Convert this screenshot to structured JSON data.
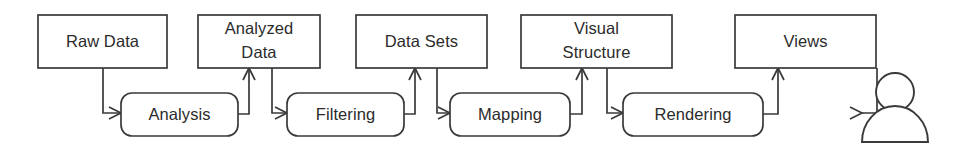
{
  "diagram": {
    "type": "flow-diagram",
    "stroke_color": "#3a3a3a",
    "text_color": "#2b2b2b",
    "background_color": "#ffffff",
    "data_nodes": [
      {
        "id": "raw-data",
        "label": "Raw Data",
        "lines": [
          "Raw Data"
        ],
        "shape": "rectangle",
        "x": 38,
        "y": 15,
        "w": 129,
        "h": 53
      },
      {
        "id": "analyzed-data",
        "label": "Analyzed Data",
        "lines": [
          "Analyzed",
          "Data"
        ],
        "shape": "rectangle",
        "x": 198,
        "y": 15,
        "w": 122,
        "h": 53
      },
      {
        "id": "data-sets",
        "label": "Data Sets",
        "lines": [
          "Data Sets"
        ],
        "shape": "rectangle",
        "x": 356,
        "y": 15,
        "w": 131,
        "h": 53
      },
      {
        "id": "visual-structure",
        "label": "Visual Structure",
        "lines": [
          "Visual",
          "Structure"
        ],
        "shape": "rectangle",
        "x": 521,
        "y": 15,
        "w": 151,
        "h": 53
      },
      {
        "id": "views",
        "label": "Views",
        "lines": [
          "Views"
        ],
        "shape": "rectangle",
        "x": 735,
        "y": 15,
        "w": 141,
        "h": 53
      }
    ],
    "process_nodes": [
      {
        "id": "analysis",
        "label": "Analysis",
        "shape": "rounded-rectangle",
        "x": 121,
        "y": 93,
        "w": 117,
        "h": 43
      },
      {
        "id": "filtering",
        "label": "Filtering",
        "shape": "rounded-rectangle",
        "x": 287,
        "y": 93,
        "w": 117,
        "h": 43
      },
      {
        "id": "mapping",
        "label": "Mapping",
        "shape": "rounded-rectangle",
        "x": 450,
        "y": 93,
        "w": 120,
        "h": 43
      },
      {
        "id": "rendering",
        "label": "Rendering",
        "shape": "rounded-rectangle",
        "x": 623,
        "y": 93,
        "w": 140,
        "h": 43
      }
    ],
    "actor": {
      "id": "user-actor",
      "label": "user",
      "head_cx": 895,
      "head_cy": 92,
      "head_r": 19,
      "body_x": 862,
      "body_y": 142,
      "body_w": 66
    },
    "edges": [
      {
        "id": "raw-data-to-analysis",
        "from": "raw-data",
        "to": "analysis",
        "path": "down-right"
      },
      {
        "id": "analysis-to-analyzed-data",
        "from": "analysis",
        "to": "analyzed-data",
        "path": "right-up"
      },
      {
        "id": "analyzed-data-to-filtering",
        "from": "analyzed-data",
        "to": "filtering",
        "path": "down-right"
      },
      {
        "id": "filtering-to-data-sets",
        "from": "filtering",
        "to": "data-sets",
        "path": "right-up"
      },
      {
        "id": "data-sets-to-mapping",
        "from": "data-sets",
        "to": "mapping",
        "path": "down-right"
      },
      {
        "id": "mapping-to-visual-structure",
        "from": "mapping",
        "to": "visual-structure",
        "path": "right-up"
      },
      {
        "id": "visual-structure-to-rendering",
        "from": "visual-structure",
        "to": "rendering",
        "path": "down-right"
      },
      {
        "id": "rendering-to-views",
        "from": "rendering",
        "to": "views",
        "path": "right-up"
      },
      {
        "id": "views-to-user",
        "from": "views",
        "to": "user-actor",
        "path": "down-right"
      }
    ]
  }
}
